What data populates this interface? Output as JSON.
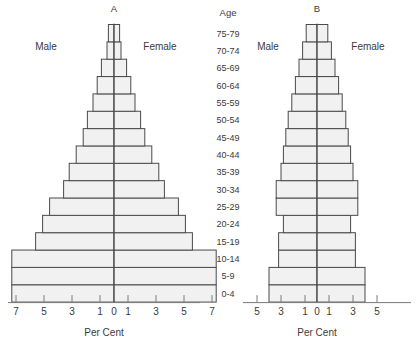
{
  "figure": {
    "background": "#ffffff",
    "bar_fill": "#f1f1f1",
    "bar_stroke": "#4a4a4a",
    "axis_color": "#7a7a7a",
    "text_color": "#3a3a3a"
  },
  "age_header": "Age",
  "age_groups": [
    "75-79",
    "70-74",
    "65-69",
    "60-64",
    "55-59",
    "50-54",
    "45-49",
    "40-44",
    "35-39",
    "30-34",
    "25-29",
    "20-24",
    "15-19",
    "10-14",
    "5-9",
    "0-4"
  ],
  "panels": [
    {
      "id": "A",
      "title": "A",
      "male_label": "Male",
      "female_label": "Female",
      "axis_title": "Per Cent",
      "tick_labels": [
        "7",
        "5",
        "3",
        "1",
        "0",
        "1",
        "3",
        "5",
        "7"
      ],
      "tick_values": [
        -7,
        -5,
        -3,
        -1,
        0,
        1,
        3,
        5,
        7
      ]
    },
    {
      "id": "B",
      "title": "B",
      "male_label": "Male",
      "female_label": "Female",
      "axis_title": "Per Cent",
      "tick_labels": [
        "5",
        "3",
        "1",
        "0",
        "1",
        "3",
        "5"
      ],
      "tick_values": [
        -5,
        -3,
        -1,
        0,
        1,
        3,
        5
      ]
    }
  ],
  "chart_data": [
    {
      "type": "bar",
      "title": "A",
      "subtitle": "Population pyramid A (expansive / rapid growth)",
      "orientation": "horizontal-diverging",
      "xlabel": "Per Cent",
      "ylabel": "Age",
      "xlim": [
        -7.6,
        7.6
      ],
      "xticks": [
        -7,
        -5,
        -3,
        -1,
        0,
        1,
        3,
        5,
        7
      ],
      "xticklabels": [
        "7",
        "5",
        "3",
        "1",
        "0",
        "1",
        "3",
        "5",
        "7"
      ],
      "grid": false,
      "legend": [
        "Male",
        "Female"
      ],
      "legend_position": "inside-top",
      "categories": [
        "0-4",
        "5-9",
        "10-14",
        "15-19",
        "20-24",
        "25-29",
        "30-34",
        "35-39",
        "40-44",
        "45-49",
        "50-54",
        "55-59",
        "60-64",
        "65-69",
        "70-74",
        "75-79"
      ],
      "series": [
        {
          "name": "Male",
          "side": "left",
          "values": [
            7.3,
            7.3,
            7.3,
            5.6,
            5.1,
            4.6,
            3.6,
            3.2,
            2.7,
            2.2,
            1.9,
            1.5,
            1.2,
            0.9,
            0.5,
            0.4
          ]
        },
        {
          "name": "Female",
          "side": "right",
          "values": [
            7.3,
            7.3,
            7.3,
            5.6,
            5.1,
            4.6,
            3.6,
            3.2,
            2.7,
            2.2,
            1.9,
            1.5,
            1.2,
            0.9,
            0.5,
            0.4
          ]
        }
      ]
    },
    {
      "type": "bar",
      "title": "B",
      "subtitle": "Population pyramid B (stationary / slow growth)",
      "orientation": "horizontal-diverging",
      "xlabel": "Per Cent",
      "ylabel": "Age",
      "xlim": [
        -5.6,
        5.6
      ],
      "xticks": [
        -5,
        -3,
        -1,
        0,
        1,
        3,
        5
      ],
      "xticklabels": [
        "5",
        "3",
        "1",
        "0",
        "1",
        "3",
        "5"
      ],
      "grid": false,
      "legend": [
        "Male",
        "Female"
      ],
      "legend_position": "inside-top",
      "categories": [
        "0-4",
        "5-9",
        "10-14",
        "15-19",
        "20-24",
        "25-29",
        "30-34",
        "35-39",
        "40-44",
        "45-49",
        "50-54",
        "55-59",
        "60-64",
        "65-69",
        "70-74",
        "75-79"
      ],
      "series": [
        {
          "name": "Male",
          "side": "left",
          "values": [
            4.0,
            4.0,
            3.2,
            3.2,
            2.8,
            3.4,
            3.4,
            3.0,
            2.8,
            2.6,
            2.4,
            2.1,
            1.8,
            1.5,
            1.2,
            0.9
          ]
        },
        {
          "name": "Female",
          "side": "right",
          "values": [
            4.0,
            4.0,
            3.2,
            3.2,
            2.8,
            3.4,
            3.4,
            3.0,
            2.8,
            2.6,
            2.4,
            2.1,
            1.8,
            1.5,
            1.2,
            0.9
          ]
        }
      ]
    }
  ]
}
